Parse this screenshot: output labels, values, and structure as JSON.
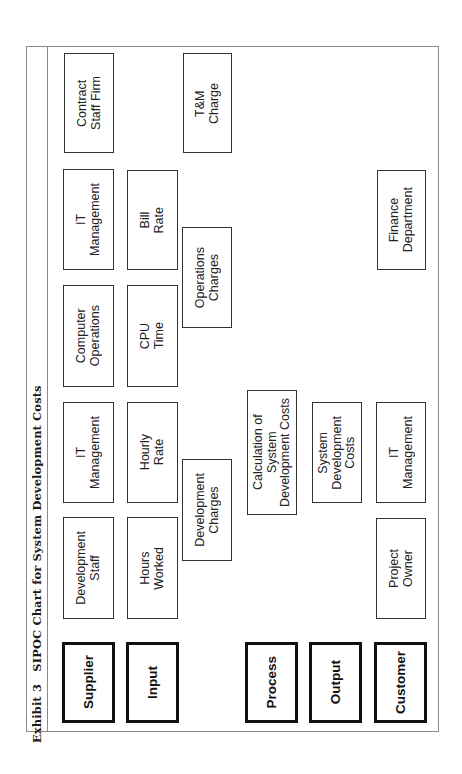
{
  "title": "Exhibit 3   SIPOC Chart for System Development Costs",
  "headers": {
    "supplier": "Supplier",
    "input": "Input",
    "process": "Process",
    "output": "Output",
    "customer": "Customer"
  },
  "suppliers": [
    "Development\nStaff",
    "IT\nManagement",
    "Computer\nOperations",
    "IT\nManagement",
    "Contract\nStaff Firm"
  ],
  "inputs": [
    "Hours\nWorked",
    "Hourly\nRate",
    "CPU\nTime",
    "Bill\nRate"
  ],
  "charges": [
    "Development\nCharges",
    "Operations\nCharges",
    "T&M\nCharge"
  ],
  "process": "Calculation of\nSystem\nDevelopment Costs",
  "output": "System\nDevelopment\nCosts",
  "customers": [
    "Project\nOwner",
    "IT\nManagement",
    "Finance\nDepartment"
  ]
}
